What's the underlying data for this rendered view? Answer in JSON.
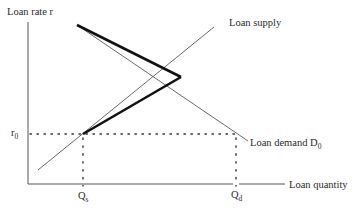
{
  "diagram": {
    "axes": {
      "y_label": "Loan rate r",
      "x_label": "Loan quantity"
    },
    "curves": {
      "supply_label": "Loan supply",
      "demand_label": "Loan demand D",
      "demand_subscript": "0"
    },
    "markers": {
      "rate_label": "r",
      "rate_subscript": "0",
      "qs_label": "Q",
      "qs_subscript": "s",
      "qd_label": "Q",
      "qd_subscript": "d"
    },
    "colors": {
      "thin_line": "#6a6a6a",
      "thick_line": "#111111",
      "axis": "#555555",
      "text": "#2a2a2a"
    }
  }
}
